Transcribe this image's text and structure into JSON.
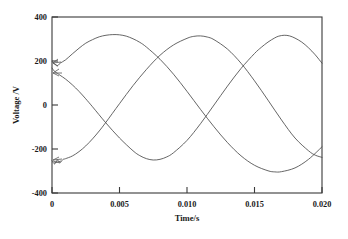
{
  "chart_data": {
    "type": "line",
    "title": "",
    "xlabel": "Time/s",
    "ylabel": "Voltage /V",
    "xlim": [
      0,
      0.02
    ],
    "ylim": [
      -400,
      400
    ],
    "xticks": [
      0,
      0.005,
      0.01,
      0.015,
      0.02
    ],
    "xtick_labels": [
      "0",
      "0.005",
      "0.010",
      "0.015",
      "0.020"
    ],
    "yticks": [
      -400,
      -200,
      0,
      200,
      400
    ],
    "ytick_labels": [
      "-400",
      "-200",
      "0",
      "200",
      "400"
    ],
    "grid": false,
    "legend": "none",
    "amplitude": 320,
    "period": 0.0222,
    "annotations": [
      "startup transient oscillation near t = 0"
    ],
    "series": [
      {
        "name": "phase-a",
        "phase_deg": 38,
        "start_value": 197,
        "end_value": 190,
        "points": [
          [
            0.0,
            197
          ],
          [
            0.0002,
            186
          ],
          [
            0.0004,
            178
          ],
          [
            0.0006,
            190
          ],
          [
            0.001,
            205
          ],
          [
            0.0015,
            232
          ],
          [
            0.002,
            258
          ],
          [
            0.0025,
            281
          ],
          [
            0.003,
            297
          ],
          [
            0.0035,
            310
          ],
          [
            0.004,
            317
          ],
          [
            0.0045,
            320
          ],
          [
            0.005,
            319
          ],
          [
            0.0055,
            313
          ],
          [
            0.006,
            301
          ],
          [
            0.0065,
            285
          ],
          [
            0.007,
            263
          ],
          [
            0.008,
            208
          ],
          [
            0.009,
            140
          ],
          [
            0.01,
            62
          ],
          [
            0.011,
            -20
          ],
          [
            0.012,
            -99
          ],
          [
            0.013,
            -171
          ],
          [
            0.014,
            -231
          ],
          [
            0.015,
            -274
          ],
          [
            0.016,
            -299
          ],
          [
            0.0165,
            -304
          ],
          [
            0.017,
            -303
          ],
          [
            0.018,
            -286
          ],
          [
            0.019,
            -247
          ],
          [
            0.02,
            -190
          ]
        ]
      },
      {
        "name": "phase-b",
        "phase_deg": 158,
        "start_value": 168,
        "end_value": -238,
        "points": [
          [
            0.0,
            168
          ],
          [
            0.0002,
            152
          ],
          [
            0.0004,
            144
          ],
          [
            0.0006,
            135
          ],
          [
            0.001,
            118
          ],
          [
            0.0015,
            92
          ],
          [
            0.002,
            62
          ],
          [
            0.0025,
            28
          ],
          [
            0.003,
            -8
          ],
          [
            0.004,
            -82
          ],
          [
            0.005,
            -150
          ],
          [
            0.006,
            -208
          ],
          [
            0.0065,
            -230
          ],
          [
            0.007,
            -244
          ],
          [
            0.0075,
            -250
          ],
          [
            0.008,
            -247
          ],
          [
            0.0085,
            -236
          ],
          [
            0.009,
            -217
          ],
          [
            0.01,
            -161
          ],
          [
            0.011,
            -85
          ],
          [
            0.012,
            0
          ],
          [
            0.013,
            86
          ],
          [
            0.014,
            166
          ],
          [
            0.015,
            234
          ],
          [
            0.0155,
            262
          ],
          [
            0.016,
            286
          ],
          [
            0.0165,
            305
          ],
          [
            0.0168,
            313
          ],
          [
            0.0172,
            317
          ],
          [
            0.0176,
            314
          ],
          [
            0.018,
            304
          ],
          [
            0.0185,
            286
          ],
          [
            0.019,
            260
          ],
          [
            0.0195,
            228
          ],
          [
            0.02,
            190
          ]
        ]
      },
      {
        "name": "phase-c",
        "phase_deg": 278,
        "start_value": -253,
        "end_value": -238,
        "points": [
          [
            0.0,
            -253
          ],
          [
            0.0002,
            -268
          ],
          [
            0.0004,
            -250
          ],
          [
            0.0006,
            -262
          ],
          [
            0.0008,
            -248
          ],
          [
            0.001,
            -244
          ],
          [
            0.0015,
            -232
          ],
          [
            0.002,
            -212
          ],
          [
            0.0025,
            -186
          ],
          [
            0.003,
            -154
          ],
          [
            0.0035,
            -118
          ],
          [
            0.004,
            -78
          ],
          [
            0.005,
            6
          ],
          [
            0.006,
            88
          ],
          [
            0.007,
            162
          ],
          [
            0.008,
            226
          ],
          [
            0.009,
            273
          ],
          [
            0.01,
            303
          ],
          [
            0.0105,
            312
          ],
          [
            0.011,
            314
          ],
          [
            0.0115,
            309
          ],
          [
            0.012,
            297
          ],
          [
            0.013,
            254
          ],
          [
            0.014,
            190
          ],
          [
            0.015,
            110
          ],
          [
            0.016,
            22
          ],
          [
            0.017,
            -68
          ],
          [
            0.018,
            -150
          ],
          [
            0.019,
            -208
          ],
          [
            0.0195,
            -228
          ],
          [
            0.02,
            -238
          ]
        ]
      }
    ]
  },
  "axes": {
    "x_title": "Time/s",
    "y_title": "Voltage /V"
  },
  "colors": {
    "curve": "#4a4a4a",
    "frame": "#3a3a3a",
    "text": "#1a1a1a",
    "background": "#ffffff"
  }
}
